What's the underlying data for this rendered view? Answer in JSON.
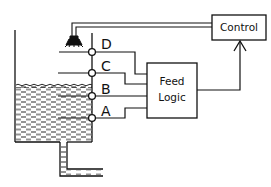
{
  "diagram": {
    "title": "",
    "colors": {
      "line": "#111111",
      "background": "#ffffff"
    },
    "control_box": {
      "label": "Control"
    },
    "feed_logic_box": {
      "label_line1": "Feed",
      "label_line2": "Logic"
    },
    "sensors": [
      {
        "id": "D",
        "label": "D"
      },
      {
        "id": "C",
        "label": "C"
      },
      {
        "id": "B",
        "label": "B"
      },
      {
        "id": "A",
        "label": "A"
      }
    ],
    "components": [
      "tank",
      "liquid",
      "spray-nozzle",
      "outlet-pipe",
      "level-probe",
      "signal-lines",
      "control-arrow"
    ]
  }
}
